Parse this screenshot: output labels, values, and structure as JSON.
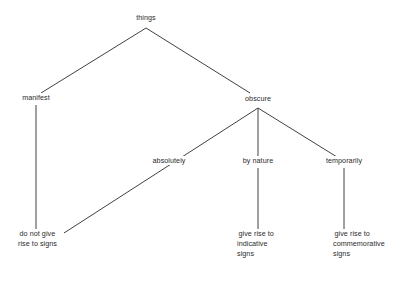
{
  "diagram": {
    "background_color": "#ffffff",
    "line_color": "#2b2b2b",
    "text_color": "#2b2b2b",
    "nodes": [
      {
        "id": "things",
        "label": "things",
        "x": 146,
        "y": 20,
        "align": "center"
      },
      {
        "id": "manifest",
        "label": "manifest",
        "x": 36,
        "y": 100,
        "align": "center"
      },
      {
        "id": "obscure",
        "label": "obscure",
        "x": 258,
        "y": 101,
        "align": "center"
      },
      {
        "id": "absolutely",
        "label": "absolutely",
        "x": 169,
        "y": 163,
        "align": "center"
      },
      {
        "id": "by-nature",
        "label": "by nature",
        "x": 258,
        "y": 163,
        "align": "center"
      },
      {
        "id": "temporarily",
        "label": "temporarily",
        "x": 344,
        "y": 163,
        "align": "center"
      },
      {
        "id": "do-not-give",
        "label": "do not give\nrise to signs",
        "x": 18,
        "y": 236,
        "align": "left"
      },
      {
        "id": "indicative",
        "label": "give rise to\nindicative\nsigns",
        "x": 237,
        "y": 236,
        "align": "left"
      },
      {
        "id": "commemorative",
        "label": "give rise to\ncommemorative\nsigns",
        "x": 333,
        "y": 236,
        "align": "left"
      }
    ],
    "edges": [
      {
        "id": "things-manifest",
        "from": "things",
        "to": "manifest",
        "x1": 146,
        "y1": 28,
        "x2": 41,
        "y2": 93
      },
      {
        "id": "things-obscure",
        "from": "things",
        "to": "obscure",
        "x1": 146,
        "y1": 28,
        "x2": 250,
        "y2": 93
      },
      {
        "id": "manifest-donotgive",
        "from": "manifest",
        "to": "do-not-give",
        "x1": 36,
        "y1": 105,
        "x2": 36,
        "y2": 233
      },
      {
        "id": "obscure-absolutely",
        "from": "obscure",
        "to": "do-not-give",
        "x1": 258,
        "y1": 108,
        "x2": 64,
        "y2": 233
      },
      {
        "id": "obscure-bynature",
        "from": "obscure",
        "to": "by-nature",
        "x1": 258,
        "y1": 108,
        "x2": 258,
        "y2": 156
      },
      {
        "id": "obscure-temporarily",
        "from": "obscure",
        "to": "temporarily",
        "x1": 258,
        "y1": 108,
        "x2": 337,
        "y2": 157
      },
      {
        "id": "bynature-indicative",
        "from": "by-nature",
        "to": "indicative",
        "x1": 258,
        "y1": 168,
        "x2": 258,
        "y2": 233
      },
      {
        "id": "temporarily-commem",
        "from": "temporarily",
        "to": "commemorative",
        "x1": 344,
        "y1": 168,
        "x2": 344,
        "y2": 233
      }
    ]
  }
}
